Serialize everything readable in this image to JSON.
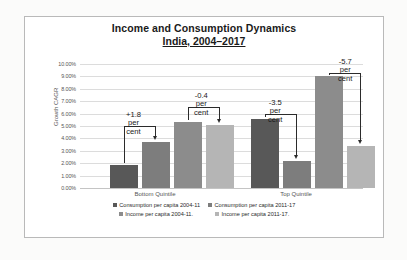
{
  "chart_data": {
    "type": "bar",
    "title": "Income and Consumption Dynamics",
    "subtitle": "India, 2004–2017",
    "xlabel": "",
    "ylabel": "Growth CAGR",
    "ylim": [
      0,
      10
    ],
    "grid": true,
    "legend_position": "bottom",
    "categories": [
      "Bottom Quintile",
      "Top Quintile"
    ],
    "ytick_labels": [
      "0.00%",
      "1.00%",
      "2.00%",
      "3.00%",
      "4.00%",
      "5.00%",
      "6.00%",
      "7.00%",
      "8.00%",
      "9.00%",
      "10.00%"
    ],
    "ytick_values": [
      0,
      1,
      2,
      3,
      4,
      5,
      6,
      7,
      8,
      9,
      10
    ],
    "series": [
      {
        "name": "Consumption per capita 2004-11",
        "color": "#585858",
        "values": [
          1.85,
          5.6
        ]
      },
      {
        "name": "Consumption per capita 2011-17",
        "color": "#7d7d7d",
        "values": [
          3.7,
          2.15
        ]
      },
      {
        "name": "Income per capita 2004-11.",
        "color": "#8c8c8c",
        "values": [
          5.35,
          9.0
        ]
      },
      {
        "name": "Income per capita 2011-17.",
        "color": "#b5b5b5",
        "values": [
          5.05,
          3.35
        ]
      }
    ],
    "annotations": [
      {
        "id": "consumption-bottom",
        "number": "+1.8",
        "unit_line1": "per",
        "unit_line2": "cent",
        "from_series": "Consumption per capita 2004-11",
        "to_series": "Consumption per capita 2011-17",
        "category": "Bottom Quintile"
      },
      {
        "id": "income-bottom",
        "number": "-0.4",
        "unit_line1": "per",
        "unit_line2": "cent",
        "from_series": "Income per capita 2004-11.",
        "to_series": "Income per capita 2011-17.",
        "category": "Bottom Quintile"
      },
      {
        "id": "consumption-top",
        "number": "-3.5",
        "unit_line1": "per",
        "unit_line2": "cent",
        "from_series": "Consumption per capita 2004-11",
        "to_series": "Consumption per capita 2011-17",
        "category": "Top Quintile"
      },
      {
        "id": "income-top",
        "number": "-5.7",
        "unit_line1": "per",
        "unit_line2": "cent",
        "from_series": "Income per capita 2004-11.",
        "to_series": "Income per capita 2011-17.",
        "category": "Top Quintile"
      }
    ]
  },
  "ticks": {
    "t10": "10.00%",
    "t9": "9.00%",
    "t8": "8.00%",
    "t7": "7.00%",
    "t6": "6.00%",
    "t5": "5.00%",
    "t4": "4.00%",
    "t3": "3.00%",
    "t2": "2.00%",
    "t1": "1.00%",
    "t0": "0.00%"
  },
  "categories": {
    "bottom": "Bottom Quintile",
    "top": "Top Quintile"
  },
  "legend": {
    "item1": "Consumption per capita 2004-11",
    "item2": "Consumption per capita 2011-17",
    "item3": "Income per capita 2004-11.",
    "item4": "Income per capita 2011-17."
  },
  "annotation_text": {
    "a1_num": "+1.8",
    "a1_l1": "per",
    "a1_l2": "cent",
    "a2_num": "-0.4",
    "a2_l1": "per",
    "a2_l2": "cent",
    "a3_num": "-3.5",
    "a3_l1": "per",
    "a3_l2": "cent",
    "a4_num": "-5.7",
    "a4_l1": "per",
    "a4_l2": "cent"
  }
}
